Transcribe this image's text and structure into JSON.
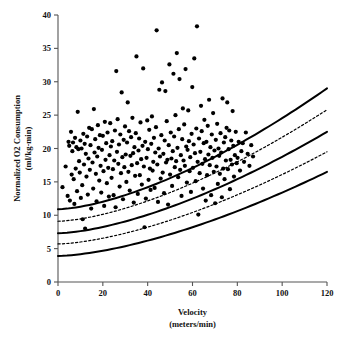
{
  "chart_data": {
    "type": "scatter",
    "title": "",
    "xlabel": "Velocity",
    "xlabel_units": "(meters/min)",
    "ylabel": "Normalized O2 Consumption",
    "ylabel_units": "(ml/kg-min)",
    "xlim": [
      0,
      120
    ],
    "ylim": [
      0,
      40
    ],
    "xticks": [
      0,
      20,
      40,
      60,
      80,
      100,
      120
    ],
    "yticks": [
      0,
      5,
      10,
      15,
      20,
      25,
      30,
      35,
      40
    ],
    "grid": false,
    "legend": "none",
    "marker": {
      "shape": "circle",
      "color": "#000000",
      "size_px": 4.2
    },
    "series": [
      {
        "name": "Normalized O2 consumption vs velocity",
        "points": [
          [
            2.0,
            14.2
          ],
          [
            3.4,
            17.3
          ],
          [
            4.3,
            12.9
          ],
          [
            4.7,
            21.0
          ],
          [
            5.0,
            20.4
          ],
          [
            5.3,
            12.2
          ],
          [
            5.8,
            22.5
          ],
          [
            6.1,
            16.1
          ],
          [
            6.4,
            19.6
          ],
          [
            6.7,
            20.9
          ],
          [
            7.0,
            15.4
          ],
          [
            7.3,
            11.7
          ],
          [
            7.6,
            21.6
          ],
          [
            7.9,
            17.0
          ],
          [
            8.2,
            20.2
          ],
          [
            8.5,
            13.6
          ],
          [
            8.8,
            25.5
          ],
          [
            9.1,
            19.9
          ],
          [
            9.4,
            18.1
          ],
          [
            9.7,
            16.4
          ],
          [
            10.0,
            21.2
          ],
          [
            10.2,
            12.6
          ],
          [
            10.5,
            20.0
          ],
          [
            10.8,
            14.5
          ],
          [
            11.0,
            9.4
          ],
          [
            11.3,
            22.2
          ],
          [
            11.6,
            17.6
          ],
          [
            11.9,
            20.7
          ],
          [
            12.1,
            8.0
          ],
          [
            12.4,
            19.2
          ],
          [
            12.7,
            15.8
          ],
          [
            13.0,
            21.8
          ],
          [
            13.3,
            13.1
          ],
          [
            13.6,
            18.5
          ],
          [
            13.9,
            23.1
          ],
          [
            14.2,
            16.8
          ],
          [
            14.5,
            20.5
          ],
          [
            14.8,
            11.0
          ],
          [
            15.1,
            22.9
          ],
          [
            15.4,
            17.9
          ],
          [
            15.7,
            14.0
          ],
          [
            16.0,
            25.9
          ],
          [
            16.3,
            19.4
          ],
          [
            16.6,
            21.4
          ],
          [
            16.9,
            16.2
          ],
          [
            17.2,
            12.1
          ],
          [
            17.5,
            18.8
          ],
          [
            17.8,
            23.5
          ],
          [
            18.1,
            20.1
          ],
          [
            18.4,
            15.2
          ],
          [
            18.7,
            22.0
          ],
          [
            19.0,
            17.4
          ],
          [
            19.3,
            13.4
          ],
          [
            19.6,
            19.8
          ],
          [
            20.0,
            21.9
          ],
          [
            20.3,
            16.6
          ],
          [
            20.6,
            11.4
          ],
          [
            20.9,
            24.0
          ],
          [
            21.2,
            18.3
          ],
          [
            21.5,
            20.8
          ],
          [
            21.8,
            14.8
          ],
          [
            22.1,
            22.4
          ],
          [
            22.4,
            17.1
          ],
          [
            22.7,
            12.8
          ],
          [
            23.0,
            19.0
          ],
          [
            23.3,
            23.8
          ],
          [
            23.6,
            20.3
          ],
          [
            23.9,
            15.6
          ],
          [
            24.2,
            21.1
          ],
          [
            24.5,
            16.9
          ],
          [
            24.8,
            13.0
          ],
          [
            25.1,
            18.2
          ],
          [
            25.4,
            22.7
          ],
          [
            25.7,
            11.2
          ],
          [
            26.0,
            31.6
          ],
          [
            26.3,
            19.5
          ],
          [
            26.6,
            24.4
          ],
          [
            26.9,
            17.7
          ],
          [
            27.2,
            20.6
          ],
          [
            27.5,
            14.3
          ],
          [
            27.8,
            22.1
          ],
          [
            28.1,
            16.3
          ],
          [
            28.4,
            28.4
          ],
          [
            28.7,
            18.7
          ],
          [
            29.0,
            12.4
          ],
          [
            29.3,
            21.3
          ],
          [
            29.6,
            17.2
          ],
          [
            29.9,
            23.3
          ],
          [
            30.2,
            19.1
          ],
          [
            30.5,
            15.0
          ],
          [
            30.8,
            20.9
          ],
          [
            31.1,
            26.9
          ],
          [
            31.4,
            16.5
          ],
          [
            31.7,
            22.6
          ],
          [
            32.0,
            13.7
          ],
          [
            32.3,
            18.9
          ],
          [
            32.6,
            21.7
          ],
          [
            32.9,
            17.5
          ],
          [
            33.2,
            24.6
          ],
          [
            33.5,
            19.3
          ],
          [
            33.8,
            11.9
          ],
          [
            34.1,
            20.2
          ],
          [
            34.4,
            15.9
          ],
          [
            34.7,
            22.3
          ],
          [
            35.0,
            33.8
          ],
          [
            35.3,
            17.8
          ],
          [
            35.6,
            13.2
          ],
          [
            35.9,
            19.7
          ],
          [
            36.2,
            21.5
          ],
          [
            36.5,
            16.0
          ],
          [
            36.8,
            23.9
          ],
          [
            37.1,
            18.4
          ],
          [
            37.4,
            14.6
          ],
          [
            37.7,
            20.4
          ],
          [
            38.0,
            32.0
          ],
          [
            38.3,
            17.3
          ],
          [
            38.6,
            8.2
          ],
          [
            38.9,
            21.0
          ],
          [
            39.2,
            12.5
          ],
          [
            39.5,
            18.6
          ],
          [
            39.8,
            24.2
          ],
          [
            40.1,
            19.9
          ],
          [
            40.4,
            15.3
          ],
          [
            40.7,
            22.8
          ],
          [
            41.0,
            17.0
          ],
          [
            41.3,
            13.8
          ],
          [
            41.6,
            20.7
          ],
          [
            41.9,
            24.8
          ],
          [
            42.2,
            16.7
          ],
          [
            42.5,
            18.0
          ],
          [
            42.8,
            21.6
          ],
          [
            43.1,
            14.1
          ],
          [
            43.4,
            19.4
          ],
          [
            43.7,
            23.2
          ],
          [
            44.0,
            37.7
          ],
          [
            44.3,
            17.6
          ],
          [
            44.6,
            12.0
          ],
          [
            44.9,
            20.0
          ],
          [
            45.2,
            28.8
          ],
          [
            45.5,
            18.8
          ],
          [
            45.8,
            15.5
          ],
          [
            46.1,
            22.0
          ],
          [
            46.4,
            29.9
          ],
          [
            46.7,
            16.4
          ],
          [
            47.0,
            19.2
          ],
          [
            47.3,
            13.3
          ],
          [
            47.6,
            21.2
          ],
          [
            47.9,
            28.6
          ],
          [
            48.2,
            17.9
          ],
          [
            48.5,
            24.1
          ],
          [
            48.8,
            18.3
          ],
          [
            49.1,
            11.6
          ],
          [
            49.4,
            20.5
          ],
          [
            49.7,
            32.6
          ],
          [
            50.0,
            16.1
          ],
          [
            50.3,
            22.4
          ],
          [
            50.6,
            18.5
          ],
          [
            50.9,
            14.4
          ],
          [
            51.2,
            19.6
          ],
          [
            51.5,
            31.2
          ],
          [
            51.8,
            21.8
          ],
          [
            52.1,
            17.2
          ],
          [
            52.4,
            25.0
          ],
          [
            52.7,
            18.1
          ],
          [
            53.0,
            34.3
          ],
          [
            53.3,
            20.1
          ],
          [
            53.6,
            15.7
          ],
          [
            53.9,
            22.9
          ],
          [
            54.2,
            30.4
          ],
          [
            54.5,
            16.8
          ],
          [
            54.8,
            19.0
          ],
          [
            55.1,
            12.9
          ],
          [
            55.4,
            21.4
          ],
          [
            55.7,
            26.0
          ],
          [
            56.0,
            18.2
          ],
          [
            56.3,
            23.6
          ],
          [
            56.6,
            17.4
          ],
          [
            56.9,
            31.9
          ],
          [
            57.2,
            20.3
          ],
          [
            57.5,
            14.9
          ],
          [
            57.8,
            19.8
          ],
          [
            58.1,
            25.7
          ],
          [
            58.4,
            21.1
          ],
          [
            58.7,
            16.6
          ],
          [
            59.0,
            18.7
          ],
          [
            59.3,
            13.5
          ],
          [
            59.6,
            22.2
          ],
          [
            59.9,
            29.2
          ],
          [
            60.2,
            17.1
          ],
          [
            60.5,
            20.6
          ],
          [
            60.8,
            33.5
          ],
          [
            61.1,
            19.3
          ],
          [
            61.4,
            15.1
          ],
          [
            61.7,
            23.0
          ],
          [
            62.0,
            38.3
          ],
          [
            62.3,
            18.0
          ],
          [
            62.6,
            10.1
          ],
          [
            62.9,
            21.5
          ],
          [
            63.2,
            16.3
          ],
          [
            63.5,
            19.5
          ],
          [
            63.8,
            26.4
          ],
          [
            64.1,
            22.6
          ],
          [
            64.4,
            17.7
          ],
          [
            64.7,
            14.0
          ],
          [
            65.0,
            20.8
          ],
          [
            65.3,
            24.3
          ],
          [
            65.6,
            18.4
          ],
          [
            65.9,
            12.2
          ],
          [
            66.2,
            21.0
          ],
          [
            66.5,
            16.0
          ],
          [
            66.8,
            23.4
          ],
          [
            67.1,
            19.1
          ],
          [
            67.4,
            27.3
          ],
          [
            67.7,
            17.5
          ],
          [
            68.0,
            20.2
          ],
          [
            68.3,
            13.0
          ],
          [
            68.6,
            22.1
          ],
          [
            68.9,
            18.6
          ],
          [
            69.2,
            25.3
          ],
          [
            69.5,
            16.5
          ],
          [
            69.8,
            19.7
          ],
          [
            70.1,
            11.8
          ],
          [
            70.4,
            21.3
          ],
          [
            70.7,
            17.3
          ],
          [
            71.0,
            23.7
          ],
          [
            71.3,
            14.7
          ],
          [
            71.6,
            20.0
          ],
          [
            71.9,
            18.9
          ],
          [
            72.2,
            16.2
          ],
          [
            72.5,
            22.3
          ],
          [
            72.8,
            19.4
          ],
          [
            73.1,
            12.7
          ],
          [
            73.4,
            27.5
          ],
          [
            73.7,
            17.0
          ],
          [
            74.0,
            20.9
          ],
          [
            74.3,
            15.4
          ],
          [
            74.6,
            21.7
          ],
          [
            74.9,
            18.2
          ],
          [
            75.2,
            23.1
          ],
          [
            75.5,
            26.9
          ],
          [
            75.8,
            16.9
          ],
          [
            76.1,
            19.9
          ],
          [
            76.4,
            22.7
          ],
          [
            76.7,
            13.9
          ],
          [
            77.0,
            18.3
          ],
          [
            77.3,
            21.2
          ],
          [
            77.6,
            17.6
          ],
          [
            77.9,
            25.6
          ],
          [
            78.2,
            20.4
          ],
          [
            78.5,
            15.8
          ],
          [
            78.9,
            19.0
          ],
          [
            79.3,
            22.5
          ],
          [
            79.7,
            17.8
          ],
          [
            80.1,
            18.6
          ],
          [
            80.6,
            21.0
          ],
          [
            81.2,
            16.7
          ],
          [
            81.8,
            19.6
          ],
          [
            82.4,
            20.8
          ],
          [
            83.0,
            18.0
          ],
          [
            83.8,
            22.4
          ],
          [
            84.6,
            19.2
          ],
          [
            85.4,
            17.4
          ],
          [
            86.2,
            20.5
          ],
          [
            87.0,
            18.8
          ]
        ]
      }
    ],
    "curves": [
      {
        "name": "upper-solid-band",
        "style": "solid",
        "width_px": 2.0,
        "y_at_x0": 10.9,
        "y_at_x120": 29.0
      },
      {
        "name": "upper-dashed-band",
        "style": "dashed",
        "width_px": 1.2,
        "y_at_x0": 9.1,
        "y_at_x120": 25.8
      },
      {
        "name": "middle-solid-band",
        "style": "solid",
        "width_px": 2.0,
        "y_at_x0": 7.3,
        "y_at_x120": 22.5
      },
      {
        "name": "lower-dashed-band",
        "style": "dashed",
        "width_px": 1.2,
        "y_at_x0": 5.7,
        "y_at_x120": 19.5
      },
      {
        "name": "lower-solid-band",
        "style": "solid",
        "width_px": 2.0,
        "y_at_x0": 3.9,
        "y_at_x120": 16.5
      }
    ]
  }
}
